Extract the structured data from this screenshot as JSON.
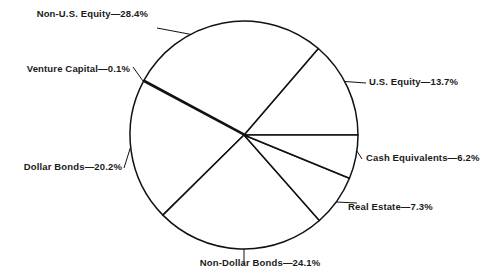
{
  "chart_data": {
    "type": "pie",
    "title": "",
    "subtitle": "",
    "xlabel": "",
    "ylabel": "",
    "legend_position": "none",
    "grid": false,
    "label_separator": "—",
    "units": "percent",
    "total": 100.0,
    "start_angle_deg": 0,
    "direction": "counterclockwise",
    "categories": [
      "U.S. Equity",
      "Non-U.S. Equity",
      "Venture Capital",
      "Dollar Bonds",
      "Non-Dollar Bonds",
      "Real Estate",
      "Cash Equivalents"
    ],
    "values": [
      13.7,
      28.4,
      0.1,
      20.2,
      24.1,
      7.3,
      6.2
    ],
    "slices": [
      {
        "name": "U.S. Equity",
        "value": 13.7,
        "label": "U.S. Equity—13.7%",
        "start_deg": 0.0,
        "end_deg": 49.32,
        "fill": "#ffffff",
        "stroke": "#111111"
      },
      {
        "name": "Non-U.S. Equity",
        "value": 28.4,
        "label": "Non-U.S. Equity—28.4%",
        "start_deg": 49.32,
        "end_deg": 151.56,
        "fill": "#ffffff",
        "stroke": "#111111"
      },
      {
        "name": "Venture Capital",
        "value": 0.1,
        "label": "Venture Capital—0.1%",
        "start_deg": 151.56,
        "end_deg": 151.92,
        "fill": "#111111",
        "stroke": "#111111"
      },
      {
        "name": "Dollar Bonds",
        "value": 20.2,
        "label": "Dollar Bonds—20.2%",
        "start_deg": 151.92,
        "end_deg": 224.64,
        "fill": "#ffffff",
        "stroke": "#111111"
      },
      {
        "name": "Non-Dollar Bonds",
        "value": 24.1,
        "label": "Non-Dollar Bonds—24.1%",
        "start_deg": 224.64,
        "end_deg": 311.4,
        "fill": "#ffffff",
        "stroke": "#111111"
      },
      {
        "name": "Real Estate",
        "value": 7.3,
        "label": "Real Estate—7.3%",
        "start_deg": 311.4,
        "end_deg": 337.68,
        "fill": "#ffffff",
        "stroke": "#111111"
      },
      {
        "name": "Cash Equivalents",
        "value": 6.2,
        "label": "Cash Equivalents—6.2%",
        "start_deg": 337.68,
        "end_deg": 360.0,
        "fill": "#ffffff",
        "stroke": "#111111"
      }
    ]
  },
  "colors": {
    "background": "#ffffff",
    "ink": "#111111",
    "text": "#1a1a1a"
  },
  "labels": {
    "non_us_equity": "Non-U.S. Equity—28.4%",
    "venture_capital": "Venture Capital—0.1%",
    "dollar_bonds": "Dollar Bonds—20.2%",
    "non_dollar_bonds": "Non-Dollar Bonds—24.1%",
    "us_equity": "U.S. Equity—13.7%",
    "cash_equivalents": "Cash Equivalents—6.2%",
    "real_estate": "Real Estate—7.3%"
  }
}
